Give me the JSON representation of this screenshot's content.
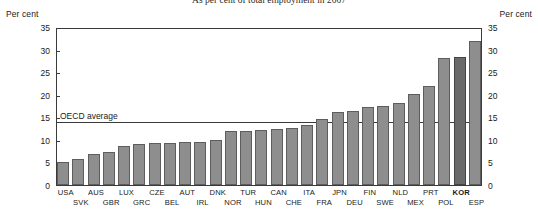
{
  "chart_data": {
    "type": "bar",
    "title": "As per cent of total employment in 2007",
    "xlabel": "",
    "ylabel": "Per cent",
    "ylabel_right": "Per cent",
    "ylim": [
      0,
      35
    ],
    "yticks": [
      0,
      5,
      10,
      15,
      20,
      25,
      30,
      35
    ],
    "grid": false,
    "legend": "none",
    "categories": [
      "USA",
      "SVK",
      "AUS",
      "GBR",
      "LUX",
      "GRC",
      "CZE",
      "BEL",
      "AUT",
      "IRL",
      "DNK",
      "NOR",
      "TUR",
      "HUN",
      "CAN",
      "CHE",
      "ITA",
      "FRA",
      "JPN",
      "DEU",
      "FIN",
      "SWE",
      "NLD",
      "MEX",
      "PRT",
      "POL",
      "KOR",
      "ESP"
    ],
    "values": [
      4.1,
      5.0,
      5.1,
      5.7,
      6.9,
      7.3,
      8.6,
      9.0,
      9.2,
      9.3,
      9.5,
      9.6,
      10.0,
      11.9,
      12.0,
      12.2,
      12.4,
      12.7,
      13.3,
      14.6,
      16.1,
      16.3,
      17.2,
      17.6,
      18.2,
      20.2,
      21.9,
      28.1
    ],
    "values_tail": [
      28.3,
      31.8
    ],
    "annotations": [
      {
        "label": "OECD average",
        "value": 14.2,
        "type": "hline"
      }
    ],
    "highlight": {
      "category": "KOR",
      "color": "#6a6a6a"
    },
    "bar_color": "#8e8e8e",
    "bar_border": "#5d5d5d",
    "axis_color": "#3a3a3a"
  },
  "chart": {
    "title": "As per cent of total employment in 2007",
    "unit_left": "Per cent",
    "unit_right": "Per cent",
    "avg_label": "OECD average"
  }
}
